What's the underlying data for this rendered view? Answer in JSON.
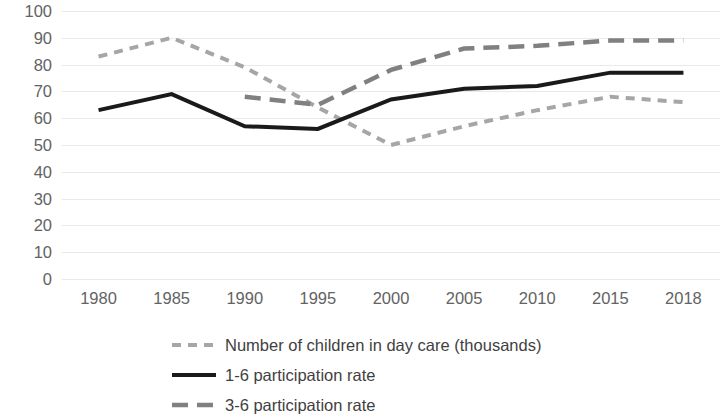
{
  "chart_data": {
    "type": "line",
    "title": "",
    "subtitle": "",
    "xlabel": "",
    "ylabel": "",
    "categories": [
      "1980",
      "1985",
      "1990",
      "1995",
      "2000",
      "2005",
      "2010",
      "2015",
      "2018"
    ],
    "ylim": [
      0,
      100
    ],
    "y_ticks": [
      0,
      10,
      20,
      30,
      40,
      50,
      60,
      70,
      80,
      90,
      100
    ],
    "grid": true,
    "legend_position": "bottom",
    "series": [
      {
        "name": "Number of children in day care (thousands)",
        "values": [
          83,
          90,
          79,
          64,
          50,
          57,
          63,
          68,
          66
        ],
        "color": "#a6a6a6",
        "style": "dashed",
        "dash": "9,7",
        "width": 4
      },
      {
        "name": "1-6 participation rate",
        "values": [
          63,
          69,
          57,
          56,
          67,
          71,
          72,
          77,
          77
        ],
        "color": "#1a1a1a",
        "style": "solid",
        "dash": "",
        "width": 4
      },
      {
        "name": "3-6 participation rate",
        "values": [
          null,
          null,
          68,
          65,
          78,
          86,
          87,
          89,
          89
        ],
        "color": "#808080",
        "style": "dashed",
        "dash": "16,9",
        "width": 4.5
      }
    ]
  },
  "axes": {
    "y_tick_labels": [
      "100",
      "90",
      "80",
      "70",
      "60",
      "50",
      "40",
      "30",
      "20",
      "10",
      "0"
    ],
    "x_tick_labels": [
      "1980",
      "1985",
      "1990",
      "1995",
      "2000",
      "2005",
      "2010",
      "2015",
      "2018"
    ]
  },
  "legend": {
    "items": [
      {
        "label": "Number of children in day care (thousands)"
      },
      {
        "label": "1-6 participation rate"
      },
      {
        "label": "3-6 participation rate"
      }
    ]
  },
  "colors": {
    "gridline": "#e9e9e9",
    "tick_text": "#636363",
    "legend_text": "#3f3f3f",
    "background": "#ffffff"
  }
}
